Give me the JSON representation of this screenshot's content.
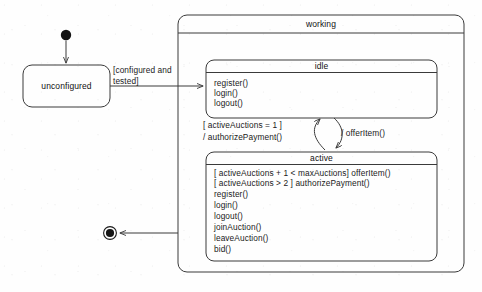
{
  "diagram": {
    "type": "uml-state-machine",
    "canvas": {
      "width": 482,
      "height": 292
    },
    "colors": {
      "stroke": "#3a3a3a",
      "text": "#1a1a1a",
      "background": "#fefefe"
    }
  },
  "initial_state": {
    "name": "initial-pseudostate"
  },
  "final_state": {
    "name": "final-state"
  },
  "states": {
    "unconfigured": {
      "label": "unconfigured"
    },
    "working": {
      "label": "working"
    },
    "idle": {
      "label": "idle",
      "operations": [
        "register()",
        "login()",
        "logout()"
      ]
    },
    "active": {
      "label": "active",
      "operations": [
        "[ activeAuctions + 1 < maxAuctions] offerItem()",
        "[ activeAuctions > 2 ] authorizePayment()",
        "register()",
        "login()",
        "logout()",
        "joinAuction()",
        "leaveAuction()",
        "bid()"
      ]
    }
  },
  "transitions": {
    "unconfigured_to_working": {
      "label_line1": "[configured and",
      "label_line2": "tested]"
    },
    "active_to_idle": {
      "label_line1": "[ activeAuctions = 1 ]",
      "label_line2": "/ authorizePayment()"
    },
    "idle_to_active": {
      "label": "/ offerItem()"
    },
    "working_to_final": {
      "label": ""
    }
  }
}
